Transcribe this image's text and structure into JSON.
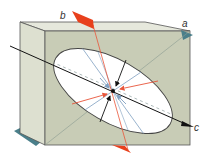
{
  "diagram": {
    "type": "strain-ellipse-block",
    "labels": {
      "a": "a",
      "b": "b",
      "c": "c"
    },
    "colors": {
      "block_front": "#c8ccb6",
      "block_side": "#dde0d0",
      "block_top": "#e6e8dc",
      "block_edge": "#555555",
      "ellipse_fill": "#ffffff",
      "plane_b": "#e8401c",
      "plane_a": "#4a7f8a",
      "axis_c": "#111111",
      "arrow_red": "#e8553a",
      "arrow_blue": "#7f9fc0",
      "arrow_black": "#111111"
    }
  }
}
